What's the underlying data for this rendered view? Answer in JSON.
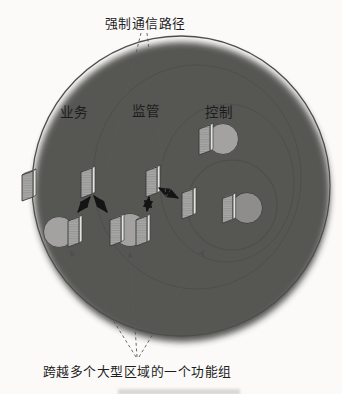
{
  "diagram": {
    "top_annotation": "强制通信路径",
    "bottom_annotation": "跨越多个大型区域的一个功能组",
    "zones": [
      {
        "id": "business",
        "name": "业务"
      },
      {
        "id": "supervision",
        "name": "监管"
      },
      {
        "id": "control",
        "name": "控制"
      }
    ],
    "elements": {
      "boundary_interface_panels": 4,
      "function_groups": 4,
      "communication_arrows": 4
    },
    "colors": {
      "background": "#fbfaf8",
      "zone_business": "#e9e8e5",
      "zone_supervision": "#d7d6d4",
      "zone_control": "#c5c4c2",
      "inner_region": "#a9a8a6",
      "function_circle": "#a3a2a0",
      "dark_circle": "#8e8d8b",
      "panel_face": "#a8a8a6",
      "arrow": "#141414",
      "leader_line": "#5a5a5a"
    }
  }
}
